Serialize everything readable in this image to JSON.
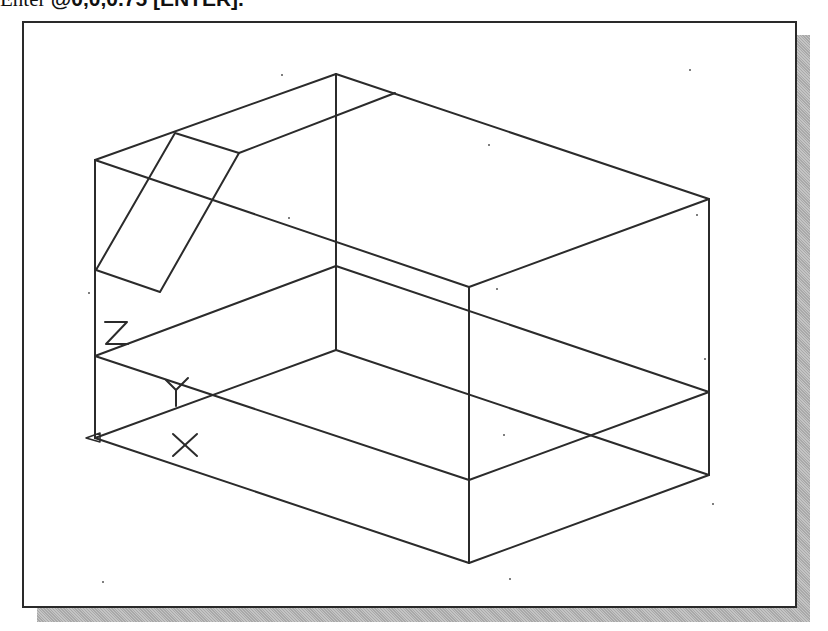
{
  "instruction": {
    "prefix": "Enter ",
    "command": "@0,0,0.75 [ENTER]."
  },
  "viewport": {
    "description": "AutoCAD isometric wireframe view of a rectangular block with an inclined rectangular cut",
    "background": "#ffffff",
    "line_color": "#2b2b2b",
    "shadow_color": "#b5b5b5"
  },
  "ucs_icon": {
    "x_label": "X",
    "y_label": "Y",
    "z_label": "Z"
  }
}
